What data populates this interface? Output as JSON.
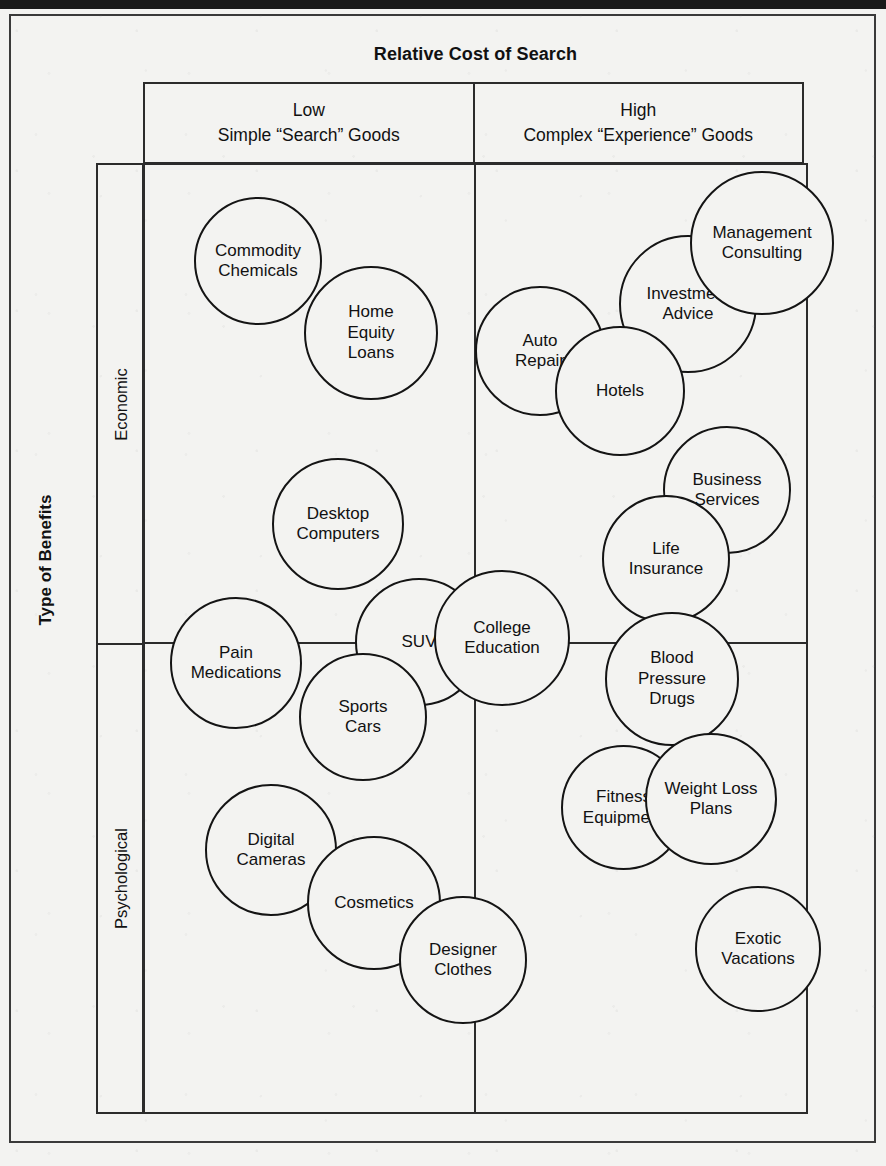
{
  "chart_data": {
    "type": "scatter",
    "title": "Relative Cost of Search",
    "xlabel": "Relative Cost of Search",
    "ylabel": "Type of Benefits",
    "x_categories": [
      "Low\nSimple “Search” Goods",
      "High\nComplex “Experience” Goods"
    ],
    "y_categories": [
      "Economic",
      "Psychological"
    ],
    "grid": true,
    "legend": "none",
    "note": "2x2 positioning matrix; each bubble is a product/service category placed in a quadrant",
    "points": [
      {
        "label": "Commodity Chemicals",
        "x_category": "Low",
        "y_category": "Economic"
      },
      {
        "label": "Home Equity Loans",
        "x_category": "Low",
        "y_category": "Economic"
      },
      {
        "label": "Desktop Computers",
        "x_category": "Low",
        "y_category": "Economic"
      },
      {
        "label": "Auto Repair",
        "x_category": "High",
        "y_category": "Economic"
      },
      {
        "label": "Hotels",
        "x_category": "High",
        "y_category": "Economic"
      },
      {
        "label": "Investment Advice",
        "x_category": "High",
        "y_category": "Economic"
      },
      {
        "label": "Management Consulting",
        "x_category": "High",
        "y_category": "Economic"
      },
      {
        "label": "Business Services",
        "x_category": "High",
        "y_category": "Economic"
      },
      {
        "label": "Life Insurance",
        "x_category": "High",
        "y_category": "Economic"
      },
      {
        "label": "Pain Medications",
        "x_category": "Low",
        "y_category": "Psychological"
      },
      {
        "label": "SUV",
        "x_category": "Low",
        "y_category": "Psychological"
      },
      {
        "label": "College Education",
        "x_category": "Low",
        "y_category": "Psychological"
      },
      {
        "label": "Sports Cars",
        "x_category": "Low",
        "y_category": "Psychological"
      },
      {
        "label": "Digital Cameras",
        "x_category": "Low",
        "y_category": "Psychological"
      },
      {
        "label": "Cosmetics",
        "x_category": "Low",
        "y_category": "Psychological"
      },
      {
        "label": "Designer Clothes",
        "x_category": "Low",
        "y_category": "Psychological"
      },
      {
        "label": "Blood Pressure Drugs",
        "x_category": "High",
        "y_category": "Psychological"
      },
      {
        "label": "Fitness Equipment",
        "x_category": "High",
        "y_category": "Psychological"
      },
      {
        "label": "Weight Loss Plans",
        "x_category": "High",
        "y_category": "Psychological"
      },
      {
        "label": "Exotic Vacations",
        "x_category": "High",
        "y_category": "Psychological"
      }
    ]
  },
  "chart": {
    "title": "Relative Cost of Search",
    "axis_title_y": "Type of Benefits",
    "columns": [
      {
        "level": "Low",
        "description": "Simple “Search” Goods"
      },
      {
        "level": "High",
        "description": "Complex “Experience” Goods"
      }
    ],
    "rows": [
      {
        "label": "Economic"
      },
      {
        "label": "Psychological"
      }
    ],
    "bubbles": [
      {
        "label": "Commodity Chemicals",
        "text": "Commodity\nChemicals",
        "left": 194,
        "top": 197,
        "size": 128
      },
      {
        "label": "Home Equity Loans",
        "text": "Home\nEquity\nLoans",
        "left": 304,
        "top": 266,
        "size": 134
      },
      {
        "label": "Auto Repair",
        "text": "Auto\nRepair",
        "left": 475,
        "top": 286,
        "size": 130
      },
      {
        "label": "Investment Advice",
        "text": "Investment\nAdvice",
        "left": 619,
        "top": 235,
        "size": 138
      },
      {
        "label": "Management Consulting",
        "text": "Management\nConsulting",
        "left": 690,
        "top": 171,
        "size": 144
      },
      {
        "label": "Hotels",
        "text": "Hotels",
        "left": 555,
        "top": 326,
        "size": 130
      },
      {
        "label": "Business Services",
        "text": "Business\nServices",
        "left": 663,
        "top": 426,
        "size": 128
      },
      {
        "label": "Life Insurance",
        "text": "Life\nInsurance",
        "left": 602,
        "top": 495,
        "size": 128
      },
      {
        "label": "Desktop Computers",
        "text": "Desktop\nComputers",
        "left": 272,
        "top": 458,
        "size": 132
      },
      {
        "label": "Pain Medications",
        "text": "Pain\nMedications",
        "left": 170,
        "top": 597,
        "size": 132
      },
      {
        "label": "SUV",
        "text": "SUV",
        "left": 355,
        "top": 578,
        "size": 128
      },
      {
        "label": "College Education",
        "text": "College\nEducation",
        "left": 434,
        "top": 570,
        "size": 136
      },
      {
        "label": "Blood Pressure Drugs",
        "text": "Blood\nPressure\nDrugs",
        "left": 605,
        "top": 612,
        "size": 134
      },
      {
        "label": "Sports Cars",
        "text": "Sports\nCars",
        "left": 299,
        "top": 653,
        "size": 128
      },
      {
        "label": "Fitness Equipment",
        "text": "Fitness\nEquipment",
        "left": 561,
        "top": 745,
        "size": 125
      },
      {
        "label": "Weight Loss Plans",
        "text": "Weight Loss\nPlans",
        "left": 645,
        "top": 733,
        "size": 132
      },
      {
        "label": "Digital Cameras",
        "text": "Digital\nCameras",
        "left": 205,
        "top": 784,
        "size": 132
      },
      {
        "label": "Cosmetics",
        "text": "Cosmetics",
        "left": 307,
        "top": 836,
        "size": 134
      },
      {
        "label": "Exotic Vacations",
        "text": "Exotic\nVacations",
        "left": 695,
        "top": 886,
        "size": 126
      },
      {
        "label": "Designer Clothes",
        "text": "Designer\nClothes",
        "left": 399,
        "top": 896,
        "size": 128
      }
    ]
  }
}
